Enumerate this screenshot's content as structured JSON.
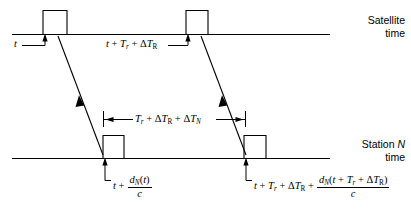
{
  "figure": {
    "type": "timing-diagram",
    "background": "#ffffff",
    "stroke_color": "#000000",
    "axes": [
      {
        "id": "satellite",
        "title_line1": "Satellite",
        "title_line2": "time",
        "y": 34
      },
      {
        "id": "station",
        "title_line1_prefix": "Station ",
        "title_line1_italic": "N",
        "title_line2": "time",
        "y": 158
      }
    ],
    "labels": {
      "transmit_first": "t",
      "transmit_second": "t + T_r + ΔT_R",
      "interval": "T_r + ΔT_R + ΔT_N",
      "receive_first": "t + d_N(t)/c",
      "receive_second": "t + T_r + ΔT_R + d_N(t + T_r + ΔT_R)/c"
    },
    "symbols": {
      "t": "t",
      "plus": "+",
      "T": "T",
      "sub_r": "r",
      "sub_R": "R",
      "sub_N": "N",
      "delta": "Δ",
      "d": "d",
      "c": "c",
      "paren_open": "(",
      "paren_close": ")"
    },
    "pulses": [
      {
        "id": "sat-pulse-1",
        "x": 43,
        "width": 24,
        "axis": "satellite"
      },
      {
        "id": "sat-pulse-2",
        "x": 186,
        "width": 22,
        "axis": "satellite"
      },
      {
        "id": "sta-pulse-1",
        "x": 103,
        "width": 21,
        "axis": "station"
      },
      {
        "id": "sta-pulse-2",
        "x": 244,
        "width": 22,
        "axis": "station"
      }
    ],
    "signal_paths": [
      {
        "id": "signal-1",
        "x1": 58,
        "y1": 36,
        "x2": 103,
        "y2": 155
      },
      {
        "id": "signal-2",
        "x1": 201,
        "y1": 36,
        "x2": 246,
        "y2": 155
      }
    ],
    "interval_bracket": {
      "x1": 103,
      "x2": 245,
      "y": 119
    }
  }
}
